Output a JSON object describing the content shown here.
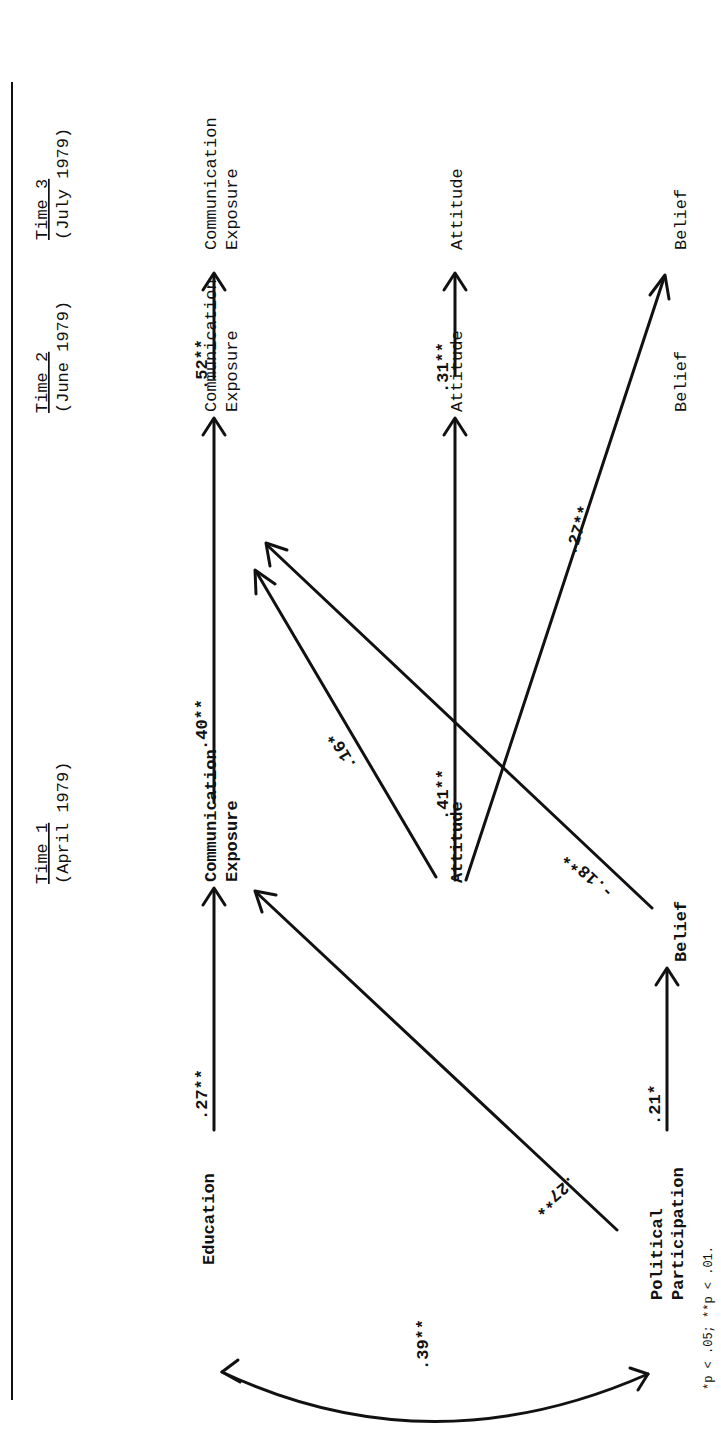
{
  "figure": {
    "orientation": "rotated 90 degrees counter-clockwise",
    "footnote": "*p < .05; **p < .01."
  },
  "time_headers": [
    {
      "title": "Time 1",
      "date": "(April 1979)"
    },
    {
      "title": "Time 2",
      "date": "(June 1979)"
    },
    {
      "title": "Time 3",
      "date": "(July 1979)"
    }
  ],
  "nodes": {
    "education": "Education",
    "political_participation_1": "Political",
    "political_participation_2": "Participation",
    "t1_comm_1": "Communication",
    "t1_comm_2": "Exposure",
    "t1_attitude": "Attitude",
    "t1_belief": "Belief",
    "t2_comm_1": "Communication",
    "t2_comm_2": "Exposure",
    "t2_attitude": "Attitude",
    "t2_belief": "Belief",
    "t3_comm_1": "Communication",
    "t3_comm_2": "Exposure",
    "t3_attitude": "Attitude",
    "t3_belief": "Belief"
  },
  "paths": [
    {
      "from": "Education",
      "to": "Communication Exposure (T1)",
      "coef": ".27**"
    },
    {
      "from": "Political Participation",
      "to": "Communication Exposure (T1)",
      "coef": ".27**"
    },
    {
      "from": "Political Participation",
      "to": "Belief (T1)",
      "coef": ".21*"
    },
    {
      "from": "Education",
      "to": "Political Participation",
      "coef": ".39**",
      "type": "correlation"
    },
    {
      "from": "Communication Exposure (T1)",
      "to": "Communication Exposure (T2)",
      "coef": ".40**"
    },
    {
      "from": "Attitude (T1)",
      "to": "Communication Exposure (T2)",
      "coef": ".16*"
    },
    {
      "from": "Attitude (T1)",
      "to": "Attitude (T2)",
      "coef": ".41**"
    },
    {
      "from": "Belief (T1)",
      "to": "Communication Exposure (T2)",
      "coef": "-.18**"
    },
    {
      "from": "Attitude (T1)",
      "to": "Belief (T3)",
      "coef": ".27**"
    },
    {
      "from": "Communication Exposure (T2)",
      "to": "Communication Exposure (T3)",
      "coef": ".52**"
    },
    {
      "from": "Attitude (T2)",
      "to": "Attitude (T3)",
      "coef": ".31**"
    }
  ],
  "coef_labels": {
    "edu_comm": ".27**",
    "pp_comm": ".27**",
    "pp_belief": ".21*",
    "edu_pp": ".39**",
    "comm12": ".40**",
    "att1_comm2": ".16*",
    "att12": ".41**",
    "bel1_comm2": "-.18**",
    "att1_bel3": ".27**",
    "comm23": ".52**",
    "att23": ".31**"
  }
}
